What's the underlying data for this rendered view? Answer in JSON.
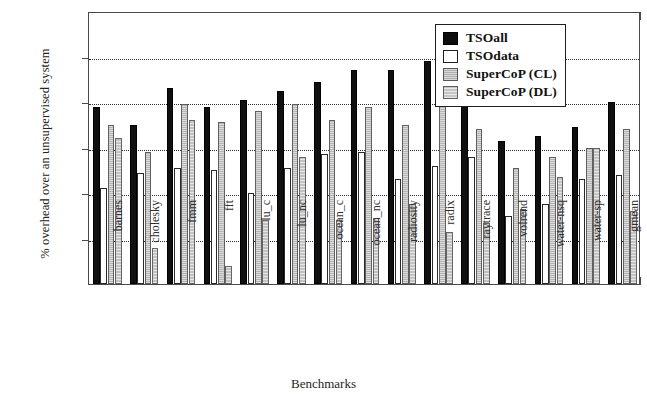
{
  "chart_data": {
    "type": "bar",
    "title": "",
    "xlabel": "Benchmarks",
    "ylabel": "% overhead over an unsupervised system",
    "ylim": [
      0,
      60
    ],
    "ytick_labels": [
      "0%",
      "10%",
      "20%",
      "30%",
      "40%",
      "50%",
      "60%"
    ],
    "ytick_values": [
      0,
      10,
      20,
      30,
      40,
      50,
      60
    ],
    "grid": "horizontal-dotted",
    "legend_position": "top-right-inside",
    "categories": [
      "barnes",
      "cholesky",
      "fmm",
      "fft",
      "lu_c",
      "lu_nc",
      "ocean_c",
      "ocean_nc",
      "radiosity",
      "radix",
      "raytrace",
      "volrend",
      "water-nsq",
      "water-sp",
      "gmean"
    ],
    "series": [
      {
        "name": "TSOall",
        "color": "#101010",
        "values": [
          39,
          35,
          43,
          39,
          40.5,
          42.5,
          44.5,
          47,
          47,
          49,
          40.5,
          31.5,
          32.5,
          34.5,
          40
        ]
      },
      {
        "name": "TSOdata",
        "color": "#ffffff",
        "values": [
          21,
          24.5,
          25.5,
          25,
          20,
          25.5,
          28.5,
          29,
          23,
          26,
          28,
          15,
          17.5,
          23,
          24
        ]
      },
      {
        "name": "SuperCoP (CL)",
        "color": "#b4b4b4",
        "values": [
          35,
          29,
          39.5,
          35.5,
          38,
          39.5,
          36,
          39,
          35,
          44,
          34,
          25.5,
          28,
          30,
          34
        ]
      },
      {
        "name": "SuperCoP (DL)",
        "color": "#c3c3c3",
        "values": [
          32,
          8,
          36,
          4,
          14,
          28,
          14,
          14.5,
          17.5,
          11.5,
          13.5,
          16.5,
          23.5,
          30,
          16
        ]
      }
    ]
  },
  "legend": {
    "entries": [
      {
        "label": "TSOall",
        "swatch": "black-filled"
      },
      {
        "label": "TSOdata",
        "swatch": "white-filled"
      },
      {
        "label": "SuperCoP (CL)",
        "swatch": "gray-filled"
      },
      {
        "label": "SuperCoP (DL)",
        "swatch": "light-gray-filled"
      }
    ]
  }
}
